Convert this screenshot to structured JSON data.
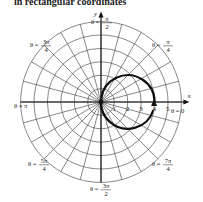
{
  "caption": "in rectangular coordinates",
  "axes": {
    "x_label": "x",
    "y_label": "y"
  },
  "ticks": [
    "1",
    "2",
    "3",
    "4",
    "5"
  ],
  "angle_labels": [
    {
      "id": "theta-0",
      "text": "θ = 0",
      "x": 171,
      "y": 113
    },
    {
      "id": "theta-pi-4",
      "num": "π",
      "den": "4",
      "prefix": "θ =",
      "x": 152,
      "y": 45
    },
    {
      "id": "theta-pi-2",
      "num": "π",
      "den": "2",
      "prefix": "θ =",
      "x": 91,
      "y": 22
    },
    {
      "id": "theta-3pi-4",
      "num": "3π",
      "den": "4",
      "prefix": "θ =",
      "x": 30,
      "y": 45
    },
    {
      "id": "theta-pi",
      "text": "θ = π",
      "x": 14,
      "y": 108
    },
    {
      "id": "theta-5pi-4",
      "num": "5π",
      "den": "4",
      "prefix": "θ =",
      "x": 28,
      "y": 164
    },
    {
      "id": "theta-3pi-2",
      "num": "3π",
      "den": "2",
      "prefix": "θ =",
      "x": 90,
      "y": 189
    },
    {
      "id": "theta-7pi-4",
      "num": "7π",
      "den": "4",
      "prefix": "θ =",
      "x": 152,
      "y": 164
    }
  ],
  "chart_data": {
    "type": "polar",
    "title": "",
    "equation": "r = 4 cos θ",
    "radial_ticks": [
      1,
      2,
      3,
      4,
      5
    ],
    "rings": 6,
    "spoke_step_deg": 15,
    "curve": {
      "kind": "circle",
      "center": [
        2,
        0
      ],
      "radius": 2,
      "direction_arrow": "near (4, 0) below axis, pointing up"
    },
    "angle_labels": [
      "θ = 0",
      "θ = π/4",
      "θ = π/2",
      "θ = 3π/4",
      "θ = π",
      "θ = 5π/4",
      "θ = 3π/2",
      "θ = 7π/4"
    ],
    "axis_labels": {
      "x": "x",
      "y": "y"
    }
  }
}
